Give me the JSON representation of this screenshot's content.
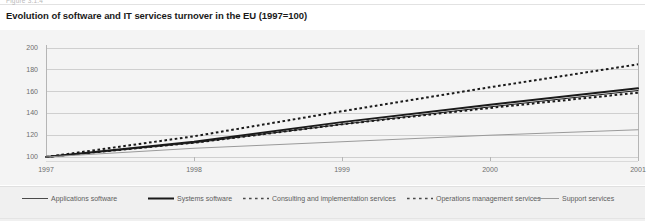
{
  "figure": {
    "caption_prefix": "Figure 3.1.4",
    "title": "Evolution of software and IT services turnover in the EU (1997=100)"
  },
  "colors": {
    "panel_background": "#f4f4f4",
    "legend_background": "#f0f0f0",
    "gridline": "#cfcfcf",
    "axis": "#b5b5b5",
    "tick_text": "#6d6d6d",
    "series_dark": "#1a1a1a",
    "series_grey": "#9a9a9a",
    "title_text": "#1a1a1a"
  },
  "chart_data": {
    "type": "line",
    "title": "Evolution of software and IT services turnover in the EU (1997=100)",
    "xlabel": "",
    "ylabel": "",
    "x": [
      "1997",
      "1998",
      "1999",
      "2000",
      "2001"
    ],
    "categories": [
      "1997",
      "1998",
      "1999",
      "2000",
      "2001"
    ],
    "ylim": [
      100,
      200
    ],
    "yticks": [
      100,
      120,
      140,
      160,
      180,
      200
    ],
    "ytick_labels": [
      "100",
      "120",
      "140",
      "160",
      "180",
      "200"
    ],
    "xtick_labels": [
      "1997",
      "1998",
      "1999",
      "2000",
      "2001"
    ],
    "grid": true,
    "grid_axis": "y",
    "legend_position": "bottom",
    "index_base": 100,
    "index_base_year": "1997",
    "series": [
      {
        "name": "Applications software",
        "values": [
          100,
          113,
          130,
          146,
          161
        ],
        "style": "solid",
        "width": 1,
        "color": "#1a1a1a"
      },
      {
        "name": "Systems software",
        "values": [
          100,
          114,
          132,
          148,
          163
        ],
        "style": "solid",
        "width": 2,
        "color": "#1a1a1a"
      },
      {
        "name": "Consulting and implementation services",
        "values": [
          100,
          119,
          142,
          164,
          185
        ],
        "style": "dotted",
        "width": 2,
        "color": "#1a1a1a"
      },
      {
        "name": "Operations management services",
        "values": [
          100,
          113,
          130,
          145,
          159
        ],
        "style": "dotted",
        "width": 2,
        "color": "#1a1a1a"
      },
      {
        "name": "Support services",
        "values": [
          100,
          108,
          114,
          120,
          125
        ],
        "style": "solid",
        "width": 1,
        "color": "#9a9a9a"
      }
    ]
  },
  "legend": {
    "items": [
      {
        "label": "Applications software",
        "style": "solid-thin",
        "color": "#4a4a4a"
      },
      {
        "label": "Systems software",
        "style": "solid-thick",
        "color": "#1a1a1a"
      },
      {
        "label": "Consulting and implementation services",
        "style": "dotted",
        "color": "#4a4a4a"
      },
      {
        "label": "Operations management services",
        "style": "dotted",
        "color": "#4a4a4a"
      },
      {
        "label": "Support services",
        "style": "solid-thin",
        "color": "#9a9a9a"
      }
    ]
  }
}
